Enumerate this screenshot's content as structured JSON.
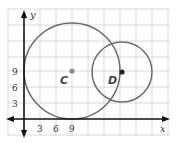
{
  "diagram": {
    "type": "coordinate-plane-circles",
    "axes": {
      "x_label": "x",
      "y_label": "y",
      "x_ticks": [
        "3",
        "6",
        "9"
      ],
      "y_ticks": [
        "9",
        "6",
        "3"
      ]
    },
    "circles": [
      {
        "name": "C",
        "center": [
          9,
          9
        ],
        "radius": 9
      },
      {
        "name": "D",
        "center": [
          18,
          9
        ],
        "radius": 6
      }
    ],
    "colors": {
      "grid": "#c8c8c8",
      "axis": "#111111",
      "circle": "#666666",
      "center_c": "#888888",
      "center_d": "#222222"
    }
  }
}
